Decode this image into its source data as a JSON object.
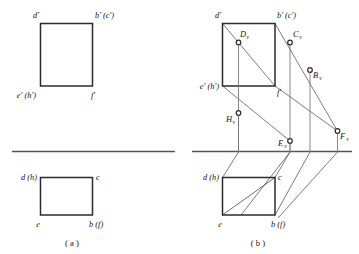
{
  "figure": {
    "panels": [
      {
        "id": "a",
        "caption": "( a )",
        "front_view": {
          "labels": [
            {
              "key": "d_prime",
              "text": "d'"
            },
            {
              "key": "bc_prime",
              "text": "b' (c')"
            },
            {
              "key": "eh_prime",
              "text": "e' (h')"
            },
            {
              "key": "f_prime",
              "text": "f'"
            }
          ]
        },
        "top_view": {
          "labels": [
            {
              "key": "dh",
              "text": "d (h)"
            },
            {
              "key": "c",
              "text": "c"
            },
            {
              "key": "e",
              "text": "e"
            },
            {
              "key": "bf",
              "text": "b (f)"
            }
          ]
        }
      },
      {
        "id": "b",
        "caption": "( b )",
        "front_view": {
          "labels": [
            {
              "key": "d_prime",
              "text": "d'"
            },
            {
              "key": "bc_prime",
              "text": "b' (c')"
            },
            {
              "key": "eh_prime",
              "text": "e' (h')"
            },
            {
              "key": "f_prime",
              "text": "f'"
            }
          ]
        },
        "top_view": {
          "labels": [
            {
              "key": "dh",
              "text": "d (h)"
            },
            {
              "key": "c",
              "text": "c"
            },
            {
              "key": "e",
              "text": "e"
            },
            {
              "key": "bf",
              "text": "b (f)"
            }
          ]
        },
        "projected_points": [
          {
            "key": "Dv",
            "base": "D",
            "sub": "v"
          },
          {
            "key": "Cv",
            "base": "C",
            "sub": "v"
          },
          {
            "key": "Bv",
            "base": "B",
            "sub": "v"
          },
          {
            "key": "Hv",
            "base": "H",
            "sub": "v"
          },
          {
            "key": "Ev",
            "base": "E",
            "sub": "v"
          },
          {
            "key": "Fv",
            "base": "F",
            "sub": "v"
          }
        ]
      }
    ]
  },
  "colors": {
    "stroke_heavy": "#2b2b2b",
    "stroke_light": "#6e6e6e",
    "ground_line": "#555555",
    "background": "#ffffff"
  }
}
